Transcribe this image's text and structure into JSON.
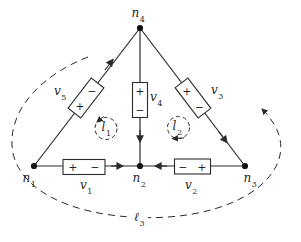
{
  "figure": {
    "type": "circuit-graph-diagram",
    "background_color": "#ffffff",
    "line_color": "#2a2a2a"
  },
  "nodes": {
    "n1": {
      "base": "n",
      "sub": "1"
    },
    "n2": {
      "base": "n",
      "sub": "2"
    },
    "n3": {
      "base": "n",
      "sub": "3"
    },
    "n4": {
      "base": "n",
      "sub": "4"
    }
  },
  "sources": {
    "v1": {
      "base": "v",
      "sub": "1",
      "left_sign": "+",
      "right_sign": "−"
    },
    "v2": {
      "base": "v",
      "sub": "2",
      "left_sign": "−",
      "right_sign": "+"
    },
    "v3": {
      "base": "v",
      "sub": "3",
      "top_sign": "+",
      "bottom_sign": "−"
    },
    "v4": {
      "base": "v",
      "sub": "4",
      "top_sign": "+",
      "bottom_sign": "−"
    },
    "v5": {
      "base": "v",
      "sub": "5",
      "top_sign": "−",
      "bottom_sign": "+"
    }
  },
  "loops": {
    "l1": {
      "base": "l",
      "sub": "1",
      "arrow_direction": "counterclockwise"
    },
    "l2": {
      "base": "l",
      "sub": "2",
      "arrow_direction": "clockwise"
    },
    "l3": {
      "base": "ℓ",
      "sub": "3",
      "arrow_direction": "counterclockwise"
    }
  },
  "branch_arrows": [
    {
      "branch": "n1-n4",
      "arrow_toward": "n4"
    },
    {
      "branch": "n4-n2",
      "arrow_toward": "n2"
    },
    {
      "branch": "n4-n3",
      "arrow_toward": "n3"
    },
    {
      "branch": "n1-n2",
      "arrow_toward": "n2"
    },
    {
      "branch": "n3-n2",
      "arrow_toward": "n2"
    }
  ]
}
